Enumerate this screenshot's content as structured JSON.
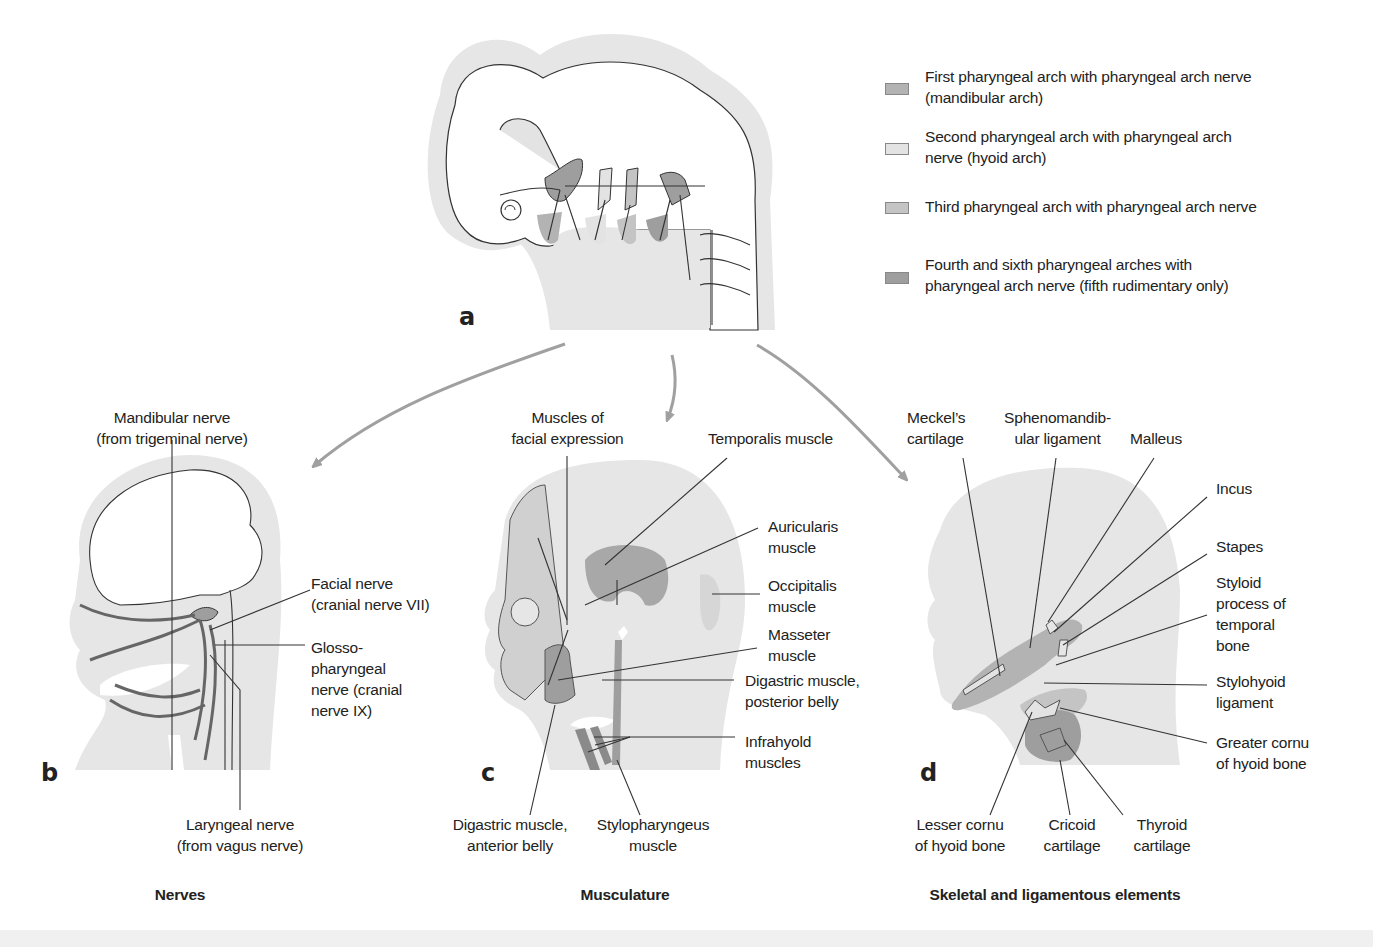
{
  "figure": {
    "legend": {
      "items": [
        {
          "label": "First pharyngeal arch with pharyngeal arch nerve\n(mandibular arch)",
          "color": "#b3b3b3"
        },
        {
          "label": "Second pharyngeal arch with pharyngeal arch\nnerve (hyoid arch)",
          "color": "#e3e3e3"
        },
        {
          "label": "Third pharyngeal arch with pharyngeal arch nerve",
          "color": "#c4c4c4"
        },
        {
          "label": "Fourth and sixth pharyngeal arches with\npharyngeal arch nerve (fifth rudimentary only)",
          "color": "#9e9e9e"
        }
      ]
    },
    "panels": {
      "a": {
        "letter": "a"
      },
      "b": {
        "letter": "b",
        "caption": "Nerves",
        "labels": {
          "mandibular_nerve": "Mandibular nerve\n(from trigeminal nerve)",
          "facial_nerve": "Facial nerve\n(cranial nerve VII)",
          "glossopharyngeal_nerve": "Glosso-\npharyngeal\nnerve (cranial\nnerve IX)",
          "laryngeal_nerve": "Laryngeal nerve\n(from vagus nerve)"
        }
      },
      "c": {
        "letter": "c",
        "caption": "Musculature",
        "labels": {
          "facial_expression": "Muscles of\nfacial expression",
          "temporalis": "Temporalis muscle",
          "auricularis": "Auricularis\nmuscle",
          "occipitalis": "Occipitalis\nmuscle",
          "masseter": "Masseter\nmuscle",
          "digastric_posterior": "Digastric muscle,\nposterior belly",
          "infrahyoid": "Infrahyold\nmuscles",
          "digastric_anterior": "Digastric muscle,\nanterior belly",
          "stylopharyngeus": "Stylopharyngeus\nmuscle"
        }
      },
      "d": {
        "letter": "d",
        "caption": "Skeletal and ligamentous elements",
        "labels": {
          "meckels_cartilage": "Meckel’s\ncartilage",
          "sphenomandibular_ligament": "Sphenomandib-\nular ligament",
          "malleus": "Malleus",
          "incus": "Incus",
          "stapes": "Stapes",
          "styloid_process": "Styloid\nprocess of\ntemporal\nbone",
          "stylohyoid_ligament": "Stylohyoid\nligament",
          "greater_cornu": "Greater cornu\nof hyoid bone",
          "lesser_cornu": "Lesser cornu\nof hyoid bone",
          "cricoid_cartilage": "Cricoid\ncartilage",
          "thyroid_cartilage": "Thyroid\ncartilage"
        }
      }
    },
    "colors": {
      "skin": "#e6e6e6",
      "arch1": "#b3b3b3",
      "arch2": "#e3e3e3",
      "arch3": "#c4c4c4",
      "arch46": "#9e9e9e",
      "arrow": "#a0a0a0",
      "line": "#333333"
    }
  }
}
